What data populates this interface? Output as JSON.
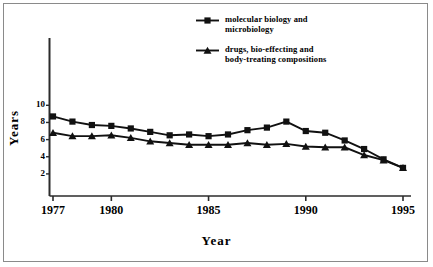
{
  "figure": {
    "background": "#ffffff",
    "border_color": "#8a8a8a",
    "ink_color": "#000000"
  },
  "chart_data": {
    "type": "line",
    "title": "",
    "subtitle": "",
    "xlabel": "Year",
    "ylabel": "Years",
    "xlim": [
      1976.6,
      1995.4
    ],
    "ylim": [
      0,
      11
    ],
    "grid": false,
    "legend_position": "top-center",
    "x": [
      1977,
      1978,
      1979,
      1980,
      1981,
      1982,
      1983,
      1984,
      1985,
      1986,
      1987,
      1988,
      1989,
      1990,
      1991,
      1992,
      1993,
      1994,
      1995
    ],
    "xticks": [
      1977,
      1980,
      1985,
      1990,
      1995
    ],
    "xticklabels": [
      "1977",
      "1980",
      "1985",
      "1990",
      "1995"
    ],
    "yticks": [
      2,
      4,
      6,
      8,
      10
    ],
    "yticklabels": [
      "2",
      "4",
      "6",
      "8",
      "10"
    ],
    "series": [
      {
        "name": "molecular biology and\nmicrobiology",
        "marker": "square",
        "values": [
          8.7,
          8.1,
          7.7,
          7.6,
          7.3,
          6.9,
          6.5,
          6.6,
          6.4,
          6.6,
          7.1,
          7.4,
          8.1,
          7.0,
          6.8,
          5.9,
          4.9,
          3.7,
          2.7
        ]
      },
      {
        "name": "drugs, bio-effecting and\nbody-treating compositions",
        "marker": "triangle",
        "values": [
          6.8,
          6.4,
          6.4,
          6.5,
          6.2,
          5.8,
          5.6,
          5.4,
          5.4,
          5.4,
          5.6,
          5.4,
          5.5,
          5.2,
          5.1,
          5.1,
          4.2,
          3.6,
          2.7
        ]
      }
    ]
  },
  "legend": {
    "entries": [
      {
        "label": "molecular biology and\nmicrobiology",
        "marker": "square"
      },
      {
        "label": "drugs, bio-effecting and\nbody-treating compositions",
        "marker": "triangle"
      }
    ]
  },
  "axes": {
    "x_title": "Year",
    "y_title": "Years"
  }
}
